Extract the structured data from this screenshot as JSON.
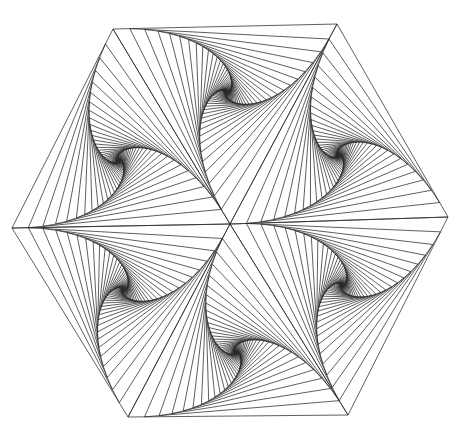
{
  "figure": {
    "stroke_color": "#2a2a2a",
    "background": "#ffffff",
    "center": [
      230,
      224
    ],
    "hexagon_vertices": [
      [
        113,
        29
      ],
      [
        337,
        24
      ],
      [
        448,
        217
      ],
      [
        348,
        415
      ],
      [
        128,
        417
      ],
      [
        12,
        228
      ]
    ],
    "iterations": 44,
    "step_fraction": 0.075,
    "alternate_direction": true
  }
}
